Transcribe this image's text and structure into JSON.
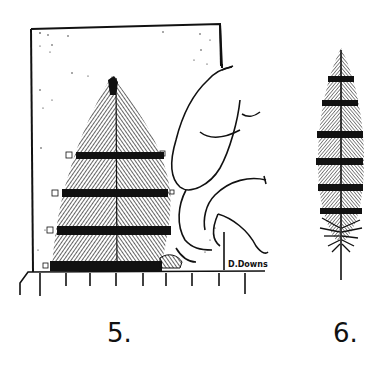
{
  "illustration": {
    "style": "black ink pen drawing on white",
    "colors": {
      "ink": "#111111",
      "paper": "#ffffff"
    },
    "figures": [
      {
        "label": "5.",
        "description": "feather pressed flat on a card with fingertips, above a ruler"
      },
      {
        "label": "6.",
        "description": "single barred feather, upright"
      }
    ],
    "signature": "D.Downs",
    "ruler_ticks": 9,
    "feather5_bars": 4,
    "feather6_bars": 6
  }
}
